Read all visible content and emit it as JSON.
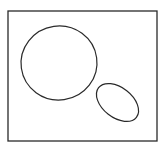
{
  "canvas": {
    "width": 164,
    "height": 150,
    "background": "#ffffff"
  },
  "stroke_color": "#2a2a2a",
  "frame": {
    "x": 8,
    "y": 11,
    "width": 149,
    "height": 130,
    "stroke_width": 1.3
  },
  "shapes": [
    {
      "kind": "circle",
      "label": "large-circle",
      "cx": 59,
      "cy": 63,
      "rx": 38,
      "ry": 37,
      "rotate": -8,
      "stroke_width": 1.2
    },
    {
      "kind": "ellipse",
      "label": "small-ellipse",
      "cx": 117.5,
      "cy": 102.5,
      "rx": 24,
      "ry": 15,
      "rotate": 38,
      "stroke_width": 1.2
    }
  ]
}
